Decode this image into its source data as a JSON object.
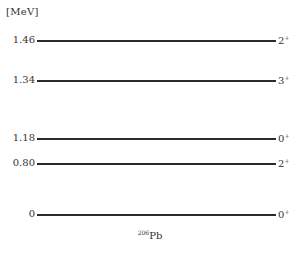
{
  "diagram": {
    "unit_label": "[MeV]",
    "nuclide": {
      "mass_number": "206",
      "symbol": "Pb"
    },
    "levels": [
      {
        "energy": "1.46",
        "spin": "2",
        "parity": "+",
        "y": 35
      },
      {
        "energy": "1.34",
        "spin": "3",
        "parity": "+",
        "y": 75
      },
      {
        "energy": "1.18",
        "spin": "0",
        "parity": "+",
        "y": 133
      },
      {
        "energy": "0.80",
        "spin": "2",
        "parity": "+",
        "y": 158
      },
      {
        "energy": "0",
        "spin": "0",
        "parity": "+",
        "y": 209
      }
    ]
  }
}
